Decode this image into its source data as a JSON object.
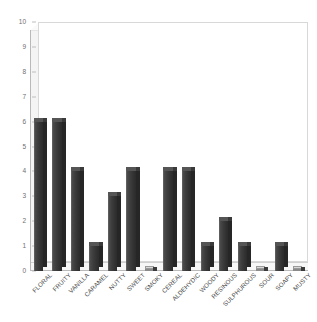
{
  "chart_data": {
    "type": "bar",
    "title": "",
    "subtitle": "",
    "xlabel": "",
    "ylabel": "",
    "ylim": [
      0,
      10
    ],
    "ytick_step": 1,
    "yticks": [
      "10",
      "9",
      "8",
      "7",
      "6",
      "5",
      "4",
      "3",
      "2",
      "1",
      "0"
    ],
    "grid": false,
    "legend": "none",
    "style": "3d-column",
    "bar_color": "#3a3a3a",
    "wall_color": "#f4f4f4",
    "axis_color": "#b9b9b9",
    "label_rotation_deg": -45,
    "categories": [
      "FLORAL",
      "FRUITY",
      "VANILLA",
      "CARAMEL",
      "NUTTY",
      "SWEET",
      "SMOKY",
      "CEREAL",
      "ALDEHYDIC",
      "WOODY",
      "RESINOUS",
      "SULPHUROUS",
      "SOUR",
      "SOAPY",
      "MUSTY"
    ],
    "values": [
      6,
      6,
      4,
      1,
      3,
      4,
      0,
      4,
      4,
      1,
      2,
      1,
      0,
      1,
      0
    ]
  }
}
